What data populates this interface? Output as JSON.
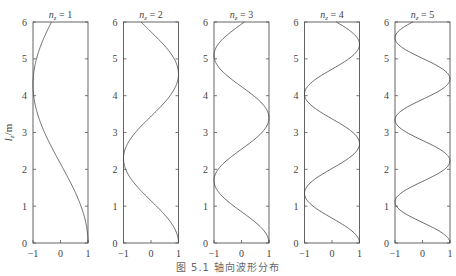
{
  "chart_data": {
    "type": "line",
    "layout": "5 side-by-side panels, shared y axis",
    "ylabel": "l_z/m",
    "ylim": [
      0,
      6
    ],
    "xlim": [
      -1,
      1
    ],
    "yticks": [
      0,
      1,
      2,
      3,
      4,
      5,
      6
    ],
    "xticks": [
      -1,
      0,
      1
    ],
    "grid": false,
    "caption": "图 5.1  轴向波形分布",
    "panels": [
      {
        "title": "n_z = 1",
        "k": 0.73,
        "description": "1 at z=0, -1 near z=4.3"
      },
      {
        "title": "n_z = 2",
        "k": 1.37,
        "description": "-1 near z=2.3, +1 near z=4.6"
      },
      {
        "title": "n_z = 3",
        "k": 1.85,
        "description": "-1 near 1.7, +1 near 3.4, -1 near 5.1"
      },
      {
        "title": "n_z = 4",
        "k": 2.33,
        "description": "extrema at 1.35, 2.7, 4.05, 5.4"
      },
      {
        "title": "n_z = 5",
        "k": 2.82,
        "description": "extrema at 1.1, 2.2, 3.35, 4.45, 5.55"
      }
    ],
    "function": "x = cos(k * z)"
  },
  "labels": {
    "ylabel_main": "l",
    "ylabel_sub": "z",
    "ylabel_unit": "/m",
    "title_prefix": "n",
    "title_sub": "z",
    "caption": "图 5.1  轴向波形分布"
  }
}
